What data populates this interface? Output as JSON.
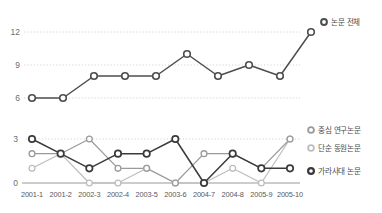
{
  "chart_data": [
    {
      "type": "line",
      "id": "top-chart",
      "title": "",
      "xlabel": "",
      "ylabel": "",
      "categories": [
        "2001-1",
        "2001-2",
        "2002-3",
        "2002-4",
        "2003-5",
        "2003-6",
        "2004-7",
        "2004-8",
        "2005-9",
        "2005-10"
      ],
      "yticks": [
        6,
        9,
        12
      ],
      "ylim": [
        5.2,
        12.6
      ],
      "grid": true,
      "legend_position": "right",
      "series": [
        {
          "name": "논문 전체",
          "color": "#4d4d4f",
          "marker": "open-circle",
          "values": [
            6,
            6,
            8,
            8,
            8,
            10,
            8,
            9,
            8,
            12
          ]
        }
      ]
    },
    {
      "type": "line",
      "id": "bottom-chart",
      "title": "",
      "xlabel": "",
      "ylabel": "",
      "categories": [
        "2001-1",
        "2001-2",
        "2002-3",
        "2002-4",
        "2003-5",
        "2003-6",
        "2004-7",
        "2004-8",
        "2005-9",
        "2005-10"
      ],
      "yticks": [
        0,
        3
      ],
      "ylim": [
        -0.2,
        3.35
      ],
      "grid": true,
      "legend_position": "right",
      "series": [
        {
          "name": "중심 연구논문",
          "color": "#9a9a9c",
          "marker": "open-circle",
          "values": [
            2,
            2,
            3,
            1,
            1,
            0,
            2,
            2,
            1,
            3
          ]
        },
        {
          "name": "단순 동원논문",
          "color": "#bdbdbf",
          "marker": "open-circle",
          "values": [
            1,
            2,
            0,
            0,
            1,
            0,
            0,
            1,
            0,
            3
          ]
        },
        {
          "name": "가라사대 논문",
          "color": "#3a3a3c",
          "marker": "open-circle",
          "values": [
            3,
            2,
            1,
            2,
            2,
            3,
            0,
            2,
            1,
            1
          ]
        }
      ]
    }
  ],
  "top": {
    "ytick_labels": [
      "12",
      "9",
      "6"
    ],
    "legend": [
      {
        "label": "논문 전체",
        "color": "#4d4d4f"
      }
    ]
  },
  "bottom": {
    "ytick_labels": [
      "3",
      "0"
    ],
    "xtick_labels": [
      "2001-1",
      "2001-2",
      "2002-3",
      "2002-4",
      "2003-5",
      "2003-6",
      "2004-7",
      "2004-8",
      "2005-9",
      "2005-10"
    ],
    "legend": [
      {
        "label": "중심 연구논문",
        "color": "#9a9a9c"
      },
      {
        "label": "단순 동원논문",
        "color": "#bdbdbf"
      },
      {
        "label": "가라사대 논문",
        "color": "#3a3a3c"
      }
    ]
  },
  "colors": {
    "background": "#ffffff",
    "grid": "#c9c9cb",
    "axis_text": "#6d6d6d",
    "baseline": "#9a9a9c",
    "series_dark": "#4d4d4f",
    "series_black": "#3a3a3c",
    "series_mid": "#9a9a9c",
    "series_light": "#bdbdbf"
  }
}
